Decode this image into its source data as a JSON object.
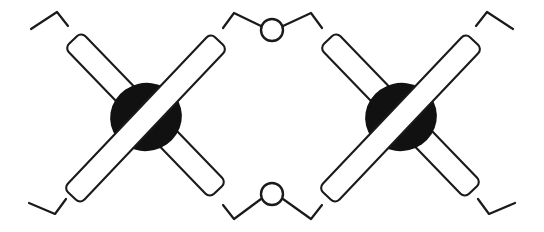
{
  "figure": {
    "title": "Interlocking crossed-bar chain pattern",
    "width": 544,
    "height": 232,
    "background_color": "#ffffff",
    "ink_color": "#1a1a1a",
    "blob_fill_color": "#111111",
    "bar_fill_color": "#ffffff",
    "stroke_width": 2.2,
    "bar_count": 4,
    "blob_count": 2,
    "ring_count": 2,
    "tail_count": 4
  },
  "motifs": [
    {
      "name": "left-cross-motif",
      "center_x": 145,
      "center_y": 118,
      "blob": {
        "name": "left-blob",
        "cx": 146,
        "cy": 117,
        "rx": 36,
        "ry": 34,
        "rotation": -14,
        "fill": "#111111"
      },
      "bars": [
        {
          "name": "left-bar-nw-se",
          "layer": "under",
          "angle": 45,
          "length": 200,
          "width": 23,
          "x1": 73,
          "y1": 40,
          "x2": 218,
          "y2": 190
        },
        {
          "name": "left-bar-sw-ne",
          "layer": "over",
          "angle": -45,
          "length": 200,
          "width": 23,
          "x1": 72,
          "y1": 196,
          "x2": 219,
          "y2": 41
        }
      ]
    },
    {
      "name": "right-cross-motif",
      "center_x": 400,
      "center_y": 118,
      "blob": {
        "name": "right-blob",
        "cx": 401,
        "cy": 117,
        "rx": 36,
        "ry": 34,
        "rotation": -14,
        "fill": "#111111"
      },
      "bars": [
        {
          "name": "right-bar-nw-se",
          "layer": "under",
          "angle": 45,
          "length": 200,
          "width": 23,
          "x1": 328,
          "y1": 40,
          "x2": 473,
          "y2": 190
        },
        {
          "name": "right-bar-sw-ne",
          "layer": "over",
          "angle": -45,
          "length": 200,
          "width": 23,
          "x1": 327,
          "y1": 196,
          "x2": 474,
          "y2": 41
        }
      ]
    }
  ],
  "rings": [
    {
      "name": "top-center-ring",
      "cx": 272,
      "cy": 30,
      "r": 11,
      "stroke": "#1a1a1a",
      "fill": "#ffffff"
    },
    {
      "name": "bottom-center-ring",
      "cx": 272,
      "cy": 194,
      "r": 11,
      "stroke": "#1a1a1a",
      "fill": "#ffffff"
    }
  ],
  "links": [
    {
      "name": "link-top-left",
      "from": "left-bar-sw-ne-top-end",
      "to": "top-center-ring",
      "points": "223,28 234,13 261,26"
    },
    {
      "name": "link-top-right",
      "from": "top-center-ring",
      "to": "right-bar-nw-se-top-end",
      "points": "283,26 311,13 322,28"
    },
    {
      "name": "link-bottom-left",
      "from": "left-bar-nw-se-bottom-end",
      "to": "bottom-center-ring",
      "points": "223,205 234,219 261,199"
    },
    {
      "name": "link-bottom-right",
      "from": "bottom-center-ring",
      "to": "right-bar-sw-ne-bottom-end",
      "points": "283,199 311,219 322,205"
    }
  ],
  "tails": [
    {
      "name": "tail-top-left",
      "points": "31,29 57,12 68,26",
      "edge": "left"
    },
    {
      "name": "tail-bottom-left",
      "points": "29,203 55,214 66,199",
      "edge": "left"
    },
    {
      "name": "tail-top-right",
      "points": "476,26 487,12 513,29",
      "edge": "right"
    },
    {
      "name": "tail-bottom-right",
      "points": "478,199 489,214 515,203",
      "edge": "right"
    }
  ]
}
